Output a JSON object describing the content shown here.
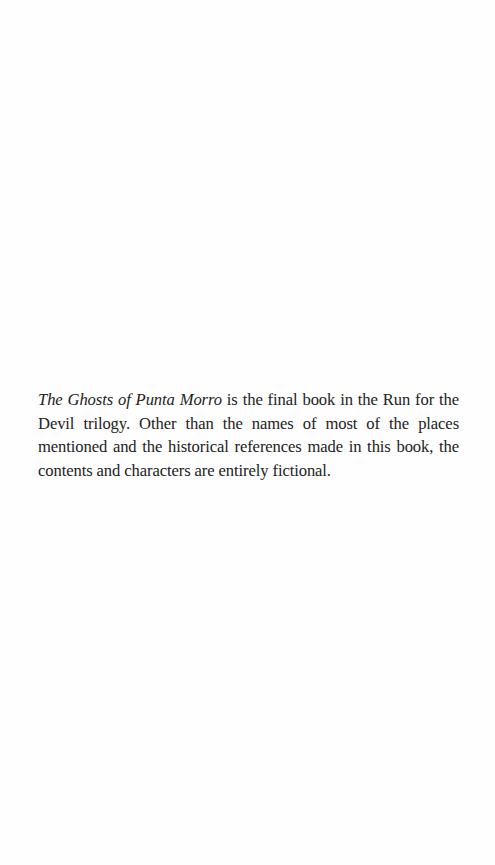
{
  "page": {
    "background": "#fefefe",
    "text_color": "#222222"
  },
  "note": {
    "book_title": "The Ghosts of Punta Morro",
    "body_text": " is the final book in the Run for the Devil trilogy. Other than the names of most of the places mentioned and the historical references made in this book, the contents and characters are entirely fictional."
  }
}
